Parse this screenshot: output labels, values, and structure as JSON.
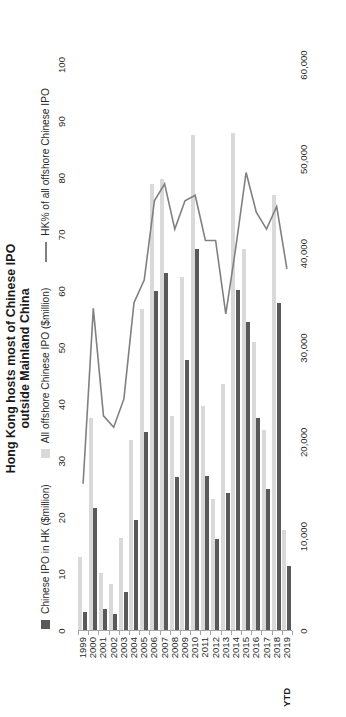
{
  "chart_title": "Hong Kong hosts most of Chinese IPO\noutside Mainland China",
  "legend": [
    {
      "key": "bar-dark",
      "label": "Chinese IPO in HK ($million)",
      "color": "#595959"
    },
    {
      "key": "bar-light",
      "label": "All offshore Chinese IPO ($million)",
      "color": "#d9d9d9"
    },
    {
      "key": "line",
      "label": "HK% of all offshore Chinese IPO",
      "color": "#808080"
    }
  ],
  "ytd_note": "YTD",
  "colors": {
    "hk_bar": "#595959",
    "total_bar": "#d9d9d9",
    "line": "#808080",
    "axis": "#a6a6a6",
    "text": "#2b2b2b"
  },
  "chart_data": {
    "type": "bar",
    "title": "Hong Kong hosts most of Chinese IPO outside Mainland China",
    "xlabel": "",
    "ylabel": "$million",
    "y2label": "%",
    "grid": false,
    "legend_position": "top",
    "categories": [
      "1999",
      "2000",
      "2001",
      "2002",
      "2003",
      "2004",
      "2005",
      "2006",
      "2007",
      "2008",
      "2009",
      "2010",
      "2011",
      "2012",
      "2013",
      "2014",
      "2015",
      "2016",
      "2017",
      "2018",
      "2019 YTD"
    ],
    "value_axis_ticks": [
      "0",
      "10,000",
      "20,000",
      "30,000",
      "40,000",
      "50,000",
      "60,000"
    ],
    "value_axis_tick_values": [
      0,
      10000,
      20000,
      30000,
      40000,
      50000,
      60000
    ],
    "ylim": [
      0,
      60000
    ],
    "percent_axis_ticks": [
      "0",
      "10",
      "20",
      "30",
      "40",
      "50",
      "60",
      "70",
      "80",
      "90",
      "100"
    ],
    "percent_axis_tick_values": [
      0,
      10,
      20,
      30,
      40,
      50,
      60,
      70,
      80,
      90,
      100
    ],
    "y2lim": [
      0,
      100
    ],
    "series": [
      {
        "name": "All offshore Chinese IPO ($million)",
        "type": "bar",
        "color": "#d9d9d9",
        "values": [
          7800,
          22600,
          6100,
          5000,
          9900,
          20300,
          34100,
          47400,
          47900,
          22800,
          37500,
          52600,
          23800,
          14000,
          26200,
          52800,
          40500,
          30600,
          21300,
          46200,
          10700
        ]
      },
      {
        "name": "Chinese IPO in HK ($million)",
        "type": "bar",
        "color": "#595959",
        "values": [
          2000,
          13000,
          2300,
          1800,
          4100,
          11800,
          21100,
          36000,
          37900,
          16300,
          28700,
          40500,
          16400,
          9700,
          14600,
          36100,
          32800,
          22600,
          15100,
          34800,
          6900
        ]
      },
      {
        "name": "HK% of all offshore Chinese IPO",
        "type": "line",
        "color": "#808080",
        "axis": "secondary",
        "values": [
          26,
          57,
          38,
          36,
          41,
          58,
          62,
          76,
          79,
          71,
          76,
          77,
          69,
          69,
          56,
          68,
          81,
          74,
          71,
          75,
          64
        ]
      }
    ]
  }
}
